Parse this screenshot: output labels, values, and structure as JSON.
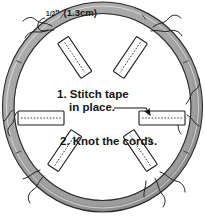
{
  "figure": {
    "background_color": "#ffffff",
    "ring_color": "#a8a8a8",
    "ring_outline_color": "#2b2b2b",
    "tape_fill_color": "#fdfdfd",
    "tape_outline_color": "#1e1e1e",
    "text_color": "#151515"
  },
  "dimension": {
    "numerator": "1",
    "denominator": "2",
    "unit_mark": "\"",
    "metric": "(1.3cm)",
    "full_label": "1/2\" (1.3cm)"
  },
  "steps": [
    {
      "number": "1.",
      "line1": "1. Stitch tape",
      "line2": "in place."
    },
    {
      "number": "2.",
      "line1": "2. Knot the cords.",
      "line2": ""
    }
  ],
  "tapes": [
    {
      "id": "tape-top-left",
      "position": "top-left",
      "angle": "-56"
    },
    {
      "id": "tape-top-right",
      "position": "top-right",
      "angle": "56"
    },
    {
      "id": "tape-left",
      "position": "left",
      "angle": "0"
    },
    {
      "id": "tape-right",
      "position": "right",
      "angle": "0"
    },
    {
      "id": "tape-bottom-left",
      "position": "bottom-left",
      "angle": "56"
    },
    {
      "id": "tape-bottom-right",
      "position": "bottom-right",
      "angle": "-56"
    }
  ],
  "cords": [
    {
      "id": "cord-top-left",
      "position": "top-left"
    },
    {
      "id": "cord-top-right",
      "position": "top-right"
    },
    {
      "id": "cord-left",
      "position": "left"
    },
    {
      "id": "cord-right",
      "position": "right"
    },
    {
      "id": "cord-bottom-left",
      "position": "bottom-left"
    },
    {
      "id": "cord-bottom-right",
      "position": "bottom-right"
    }
  ]
}
